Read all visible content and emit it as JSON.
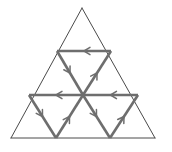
{
  "figure": {
    "type": "geometric-diagram",
    "canvas": {
      "width": 172,
      "height": 152,
      "background": "#ffffff"
    },
    "colors": {
      "outer_edge": "#4a4a4a",
      "inner_vector": "#6e6e6e",
      "arrow_head": "#6e6e6e",
      "background": "#ffffff"
    },
    "stroke_widths": {
      "outer_edge": 1,
      "inner_vector": 2.6,
      "arrow_head": 1.5
    },
    "vertices": {
      "apex": {
        "label": "A",
        "x": 82,
        "y": 8
      },
      "bottom_left": {
        "label": "B",
        "x": 11,
        "y": 138
      },
      "bottom_right": {
        "label": "C",
        "x": 155,
        "y": 138
      },
      "mid_left": {
        "label": "M_AB",
        "x": 46,
        "y": 73
      },
      "mid_right": {
        "label": "M_AC",
        "x": 118,
        "y": 73
      },
      "mid_bottom": {
        "label": "M_BC",
        "x": 83,
        "y": 138
      },
      "center": {
        "label": "O",
        "x": 83,
        "y": 95
      }
    },
    "outer_edges": [
      {
        "name": "edge-apex-to-bottom-left",
        "from": "apex",
        "to": "bottom_left",
        "arrow": false
      },
      {
        "name": "edge-apex-to-bottom-right",
        "from": "apex",
        "to": "bottom_right",
        "arrow": false
      },
      {
        "name": "edge-bottom",
        "from": "bottom_left",
        "to": "bottom_right",
        "arrow": false
      }
    ],
    "inner_vectors": [
      {
        "name": "vector-upper-midline",
        "from": "mid_right",
        "to": "mid_left",
        "x1": 111,
        "y1": 51,
        "x2": 57,
        "y2": 51,
        "direction": "left",
        "arrow_at": "midpoint",
        "angle_deg": 180
      },
      {
        "name": "vector-middle-left-midline",
        "from": "center",
        "to": "mid_left",
        "x1": 83,
        "y1": 95,
        "x2": 29,
        "y2": 95,
        "direction": "left",
        "arrow_at": "midpoint",
        "angle_deg": 180
      },
      {
        "name": "vector-middle-right-midline",
        "from": "mid_right",
        "to": "center",
        "x1": 138,
        "y1": 95,
        "x2": 83,
        "y2": 95,
        "direction": "left",
        "arrow_at": "midpoint",
        "angle_deg": 180
      },
      {
        "name": "vector-upper-left-diagonal",
        "from": "mid_left-upper",
        "to": "center",
        "x1": 57,
        "y1": 51,
        "x2": 83,
        "y2": 95,
        "direction": "down-right",
        "arrow_at": "midpoint",
        "angle_deg": 59
      },
      {
        "name": "vector-upper-right-diagonal",
        "from": "center",
        "to": "mid_right-upper",
        "x1": 83,
        "y1": 95,
        "x2": 111,
        "y2": 51,
        "direction": "up-right",
        "arrow_at": "midpoint",
        "angle_deg": -58
      },
      {
        "name": "vector-lower-left-diagonal",
        "from": "mid_left-lower",
        "to": "mid_bottom",
        "x1": 29,
        "y1": 95,
        "x2": 56,
        "y2": 138,
        "direction": "down-right",
        "arrow_at": "midpoint",
        "angle_deg": 58
      },
      {
        "name": "vector-lower-left-inner-diagonal",
        "from": "mid_bottom-left",
        "to": "center",
        "x1": 56,
        "y1": 138,
        "x2": 83,
        "y2": 95,
        "direction": "up-right",
        "arrow_at": "midpoint",
        "angle_deg": -58
      },
      {
        "name": "vector-lower-right-outer-diagonal",
        "from": "center",
        "to": "mid_bottom-right",
        "x1": 83,
        "y1": 95,
        "x2": 110,
        "y2": 138,
        "direction": "down-right",
        "arrow_at": "midpoint",
        "angle_deg": 58
      },
      {
        "name": "vector-lower-right-inner-diagonal",
        "from": "mid_bottom-right2",
        "to": "mid_right-lower",
        "x1": 110,
        "y1": 138,
        "x2": 138,
        "y2": 95,
        "direction": "up-right",
        "arrow_at": "midpoint",
        "angle_deg": -57
      }
    ],
    "sub_triangles": [
      {
        "name": "top-triangle",
        "orientation": "up"
      },
      {
        "name": "left-triangle",
        "orientation": "up"
      },
      {
        "name": "right-triangle",
        "orientation": "up"
      },
      {
        "name": "center-triangle",
        "orientation": "down"
      }
    ],
    "counts": {
      "outer_edges": 3,
      "inner_vectors": 9,
      "arrow_heads": 9,
      "sub_triangles": 4
    }
  }
}
